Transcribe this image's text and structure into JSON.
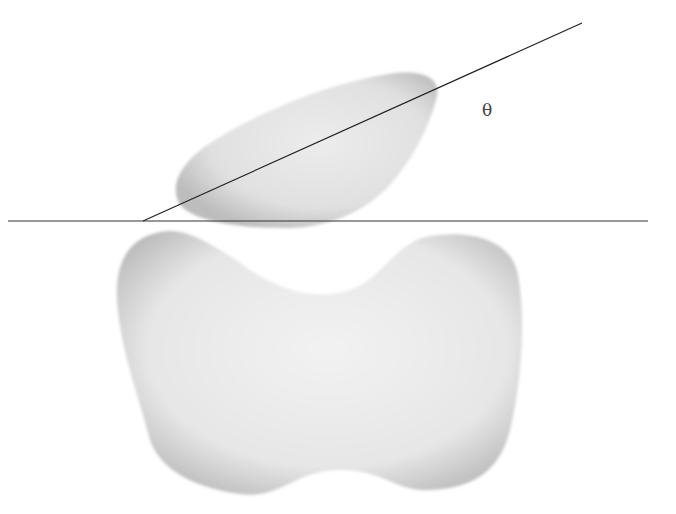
{
  "diagram": {
    "angle_label": "θ",
    "colors": {
      "background": "#ffffff",
      "blob_fill": "#e6e6e6",
      "blob_edge": "#b8b8b8",
      "line": "#222222"
    }
  }
}
